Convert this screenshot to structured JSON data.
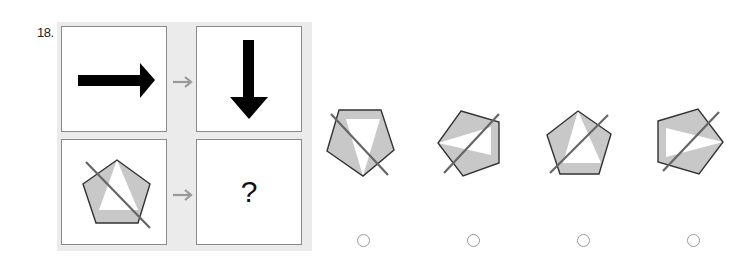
{
  "question": {
    "number": "18.",
    "matrix": {
      "top_left": {
        "figure": "arrow-right",
        "color": "#000000"
      },
      "top_right": {
        "figure": "arrow-down",
        "color": "#000000"
      },
      "bottom_left": {
        "figure": "pentagon-shaded-with-diagonal-line"
      },
      "bottom_right": {
        "figure": "unknown",
        "text": "?"
      },
      "transition_arrow": "→",
      "transition_arrow_color": "#999999"
    },
    "options": [
      {
        "id": "A",
        "figure": "pentagon-variant-1",
        "selected": false
      },
      {
        "id": "B",
        "figure": "pentagon-variant-2",
        "selected": false
      },
      {
        "id": "C",
        "figure": "pentagon-variant-3",
        "selected": false
      },
      {
        "id": "D",
        "figure": "pentagon-variant-4",
        "selected": false
      }
    ],
    "colors": {
      "shape_fill": "#c8c8c8",
      "shape_stroke": "#333333",
      "line_stroke": "#666666",
      "panel_border": "#8a8a8a",
      "matrix_background": "#ebebeb"
    }
  }
}
